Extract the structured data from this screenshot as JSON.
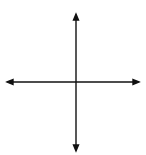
{
  "figure": {
    "type": "coordinate-plane",
    "grid": {
      "cols": 10,
      "rows": 10,
      "x_range": [
        -5,
        5
      ],
      "y_range": [
        -5,
        5
      ]
    },
    "axis_labels": {
      "x": "x",
      "y": "y",
      "origin": "O"
    },
    "colors": {
      "grid": "#777777",
      "axes": "#111111",
      "shape": "#111111",
      "background": "#ffffff"
    },
    "triangles": [
      {
        "name": "upper-triangle",
        "vertices": [
          [
            0,
            4
          ],
          [
            -2,
            3
          ],
          [
            4,
            0
          ]
        ]
      },
      {
        "name": "lower-triangle",
        "vertices": [
          [
            0,
            -4
          ],
          [
            -2,
            -3
          ],
          [
            4,
            0
          ]
        ]
      }
    ]
  }
}
